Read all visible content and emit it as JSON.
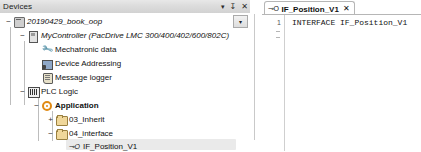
{
  "devices_panel": {
    "title": "Devices",
    "header_buttons": [
      {
        "name": "dropdown-icon",
        "glyph": "▾"
      },
      {
        "name": "pin-icon",
        "glyph": "↧"
      },
      {
        "name": "close-icon",
        "glyph": "✕"
      }
    ],
    "tree_dropdown_glyph": "▾",
    "tree": [
      {
        "label": "20190429_book_oop",
        "icon": "project-icon",
        "expander": "−",
        "style": "italic"
      },
      {
        "label": "MyController (PacDrive LMC 300/400/402/600/802C)",
        "icon": "controller-icon",
        "expander": "−",
        "style": "italic"
      },
      {
        "label": "Mechatronic data",
        "icon": "wrench-icon",
        "expander": "",
        "style": "normal"
      },
      {
        "label": "Device Addressing",
        "icon": "device-addressing-icon",
        "expander": "",
        "style": "normal"
      },
      {
        "label": "Message logger",
        "icon": "message-logger-icon",
        "expander": "",
        "style": "normal"
      },
      {
        "label": "PLC Logic",
        "icon": "plc-logic-icon",
        "expander": "−",
        "style": "normal"
      },
      {
        "label": "Application",
        "icon": "application-icon",
        "expander": "−",
        "style": "bold"
      },
      {
        "label": "03_Inherit",
        "icon": "folder-icon",
        "expander": "+",
        "style": "normal"
      },
      {
        "label": "04_interface",
        "icon": "folder-icon",
        "expander": "−",
        "style": "normal"
      },
      {
        "label": "IF_Position_V1",
        "icon": "interface-icon",
        "expander": "",
        "style": "normal"
      }
    ],
    "interface_icon_glyph": "⊸O"
  },
  "editor": {
    "tab": {
      "label": "IF_Position_V1",
      "icon_glyph": "⊸O",
      "close_glyph": "✕"
    },
    "line_numbers": [
      "1"
    ],
    "code_lines": [
      "INTERFACE IF_Position_V1"
    ]
  }
}
